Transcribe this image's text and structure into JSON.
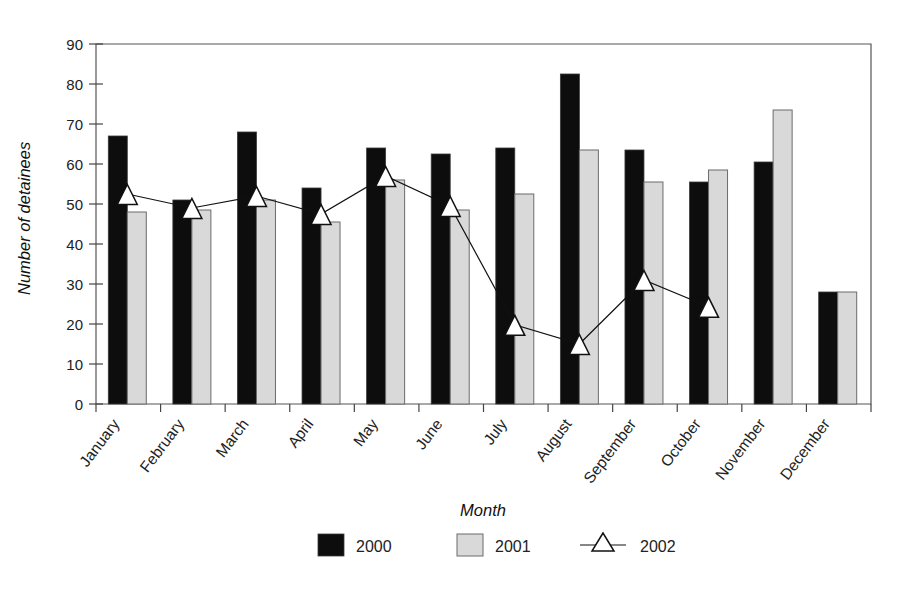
{
  "chart_data": {
    "type": "bar",
    "title": "",
    "xlabel": "Month",
    "ylabel": "Number of detainees",
    "ylim": [
      0,
      90
    ],
    "yticks": [
      0,
      10,
      20,
      30,
      40,
      50,
      60,
      70,
      80,
      90
    ],
    "grid": false,
    "legend_position": "bottom",
    "categories": [
      "January",
      "February",
      "March",
      "April",
      "May",
      "June",
      "July",
      "August",
      "September",
      "October",
      "November",
      "December"
    ],
    "series": [
      {
        "name": "2000",
        "kind": "bar",
        "color": "#0d0d0d",
        "values": [
          67,
          51,
          68,
          54,
          64,
          62.5,
          64,
          82.5,
          63.5,
          55.5,
          60.5,
          28
        ]
      },
      {
        "name": "2001",
        "kind": "bar",
        "color": "#d9d9d9",
        "values": [
          48,
          48.5,
          51,
          45.5,
          56,
          48.5,
          52.5,
          63.5,
          55.5,
          58.5,
          73.5,
          28
        ]
      },
      {
        "name": "2002",
        "kind": "line-marker",
        "color": "#ffffff",
        "marker": "triangle-up",
        "values": [
          52.5,
          49,
          52,
          47.5,
          57,
          49.5,
          19.8,
          15,
          31,
          24.3,
          null,
          null
        ]
      }
    ]
  },
  "axis": {
    "y_tick_labels": [
      "0",
      "10",
      "20",
      "30",
      "40",
      "50",
      "60",
      "70",
      "80",
      "90"
    ],
    "y_axis_title": "Number of detainees",
    "x_axis_title": "Month",
    "x_tick_labels": [
      "January",
      "February",
      "March",
      "April",
      "May",
      "June",
      "July",
      "August",
      "September",
      "October",
      "November",
      "December"
    ]
  },
  "legend": {
    "items": [
      {
        "label": "2000",
        "swatch": "black-square"
      },
      {
        "label": "2001",
        "swatch": "gray-square"
      },
      {
        "label": "2002",
        "swatch": "line-triangle-marker"
      }
    ]
  }
}
